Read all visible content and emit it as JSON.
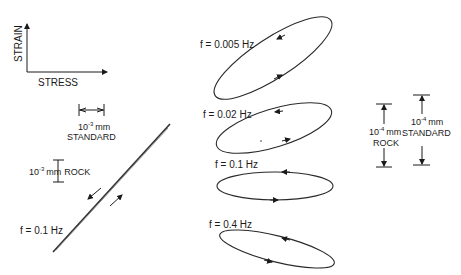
{
  "axes_key": {
    "y_label": "STRAIN",
    "x_label": "STRESS"
  },
  "left_scale": {
    "standard_value": "10",
    "standard_exp": "-3",
    "standard_unit": "mm",
    "standard_label": "STANDARD",
    "rock_value": "10",
    "rock_exp": "-3",
    "rock_unit": "mm",
    "rock_label": "ROCK"
  },
  "left_plot": {
    "freq_label": "f = 0.1 Hz"
  },
  "loops": [
    {
      "freq_label": "f = 0.005 Hz"
    },
    {
      "freq_label": "f = 0.02 Hz"
    },
    {
      "freq_label": "f = 0.1 Hz"
    },
    {
      "freq_label": "f = 0.4 Hz"
    }
  ],
  "right_scale": {
    "rock_value": "10",
    "rock_exp": "-4",
    "rock_unit": "mm",
    "rock_label": "ROCK",
    "standard_value": "10",
    "standard_exp": "-4",
    "standard_unit": "mm",
    "standard_label": "STANDARD"
  },
  "colors": {
    "ink": "#1a1a1a",
    "background": "#ffffff"
  }
}
